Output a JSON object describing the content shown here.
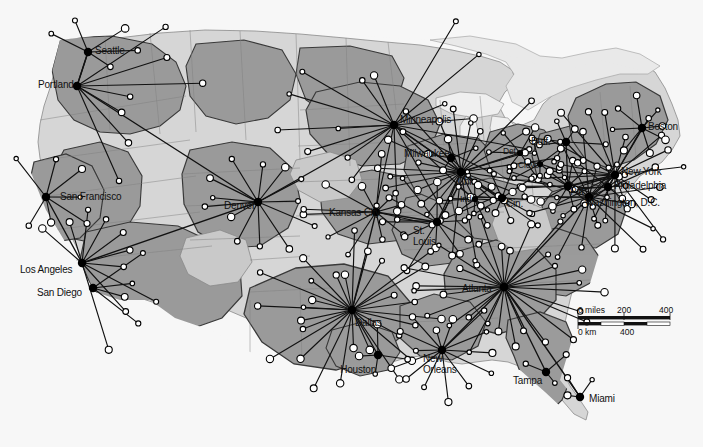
{
  "map": {
    "title": "United States Airline Hub-and-Spoke Network",
    "projection_note": "",
    "colors": {
      "background": "#f7f7f7",
      "territory_fill": "#9b9b9b",
      "territory_fill_light": "#c9c9c9",
      "land_neutral": "#d6d6d6",
      "water": "#efefef",
      "state_border": "#8a8a8a",
      "territory_border": "#3a3a3a",
      "route_line": "#111111",
      "hub_dot": "#000000",
      "spoke_dot_fill": "#ffffff",
      "spoke_dot_stroke": "#000000",
      "label_text": "#111111"
    }
  },
  "scale_bar": {
    "miles_label": "0 miles",
    "miles_mid": "200",
    "miles_end": "400",
    "km_label": "0 km",
    "km_mid": "400"
  },
  "hubs": [
    {
      "name": "Seattle",
      "label": "Seattle",
      "x": 88,
      "y": 52,
      "lx": 95,
      "ly": 45,
      "size": "major",
      "anchor": "left"
    },
    {
      "name": "Portland",
      "label": "Portland",
      "x": 77,
      "y": 86,
      "lx": 38,
      "ly": 79,
      "size": "major",
      "anchor": "left"
    },
    {
      "name": "San Francisco",
      "label": "San Francisco",
      "x": 46,
      "y": 197,
      "lx": 60,
      "ly": 191,
      "size": "major",
      "anchor": "left"
    },
    {
      "name": "Los Angeles",
      "label": "Los Angeles",
      "x": 82,
      "y": 263,
      "lx": 20,
      "ly": 264,
      "size": "major",
      "anchor": "left"
    },
    {
      "name": "San Diego",
      "label": "San Diego",
      "x": 93,
      "y": 288,
      "lx": 37,
      "ly": 287,
      "size": "major",
      "anchor": "left"
    },
    {
      "name": "Denver",
      "label": "Denver",
      "x": 258,
      "y": 202,
      "lx": 224,
      "ly": 200,
      "size": "major",
      "anchor": "left"
    },
    {
      "name": "Minneapolis",
      "label": "Minneapolis",
      "x": 394,
      "y": 125,
      "lx": 400,
      "ly": 114,
      "size": "major",
      "anchor": "left"
    },
    {
      "name": "Milwaukee",
      "label": "Milwaukee",
      "x": 451,
      "y": 158,
      "lx": 404,
      "ly": 148,
      "size": "major",
      "anchor": "left"
    },
    {
      "name": "Kansas City",
      "label": "Kansas City",
      "x": 376,
      "y": 212,
      "lx": 329,
      "ly": 207,
      "size": "major",
      "anchor": "left"
    },
    {
      "name": "St. Louis",
      "label": "St.",
      "label2": "Louis",
      "x": 437,
      "y": 222,
      "lx": 413,
      "ly": 225,
      "size": "major",
      "anchor": "left"
    },
    {
      "name": "Chicago",
      "label": "Chi.",
      "x": 461,
      "y": 172,
      "lx": 457,
      "ly": 176,
      "size": "major",
      "anchor": "left"
    },
    {
      "name": "Detroit",
      "label": "Det.",
      "x": 520,
      "y": 153,
      "lx": 503,
      "ly": 146,
      "size": "minor",
      "anchor": "left"
    },
    {
      "name": "Cleveland",
      "label": "Cleve.",
      "x": 540,
      "y": 164,
      "lx": 518,
      "ly": 160,
      "size": "minor",
      "anchor": "left"
    },
    {
      "name": "Buffalo",
      "label": "Buff.",
      "x": 566,
      "y": 142,
      "lx": 531,
      "ly": 136,
      "size": "major",
      "anchor": "left"
    },
    {
      "name": "Indianapolis",
      "label": "Ind.",
      "x": 475,
      "y": 199,
      "lx": 460,
      "ly": 194,
      "size": "minor",
      "anchor": "left"
    },
    {
      "name": "Cincinnati",
      "label": "Cin.",
      "x": 502,
      "y": 198,
      "lx": 506,
      "ly": 198,
      "size": "major",
      "anchor": "left"
    },
    {
      "name": "Pittsburgh",
      "label": "Pitt.",
      "x": 568,
      "y": 186,
      "lx": 570,
      "ly": 186,
      "size": "major",
      "anchor": "left"
    },
    {
      "name": "New York",
      "label": "New York",
      "x": 615,
      "y": 175,
      "lx": 621,
      "ly": 166,
      "size": "major",
      "anchor": "left"
    },
    {
      "name": "Boston",
      "label": "Boston",
      "x": 642,
      "y": 128,
      "lx": 648,
      "ly": 121,
      "size": "major",
      "anchor": "left"
    },
    {
      "name": "Philadelphia",
      "label": "Philadelphia",
      "x": 608,
      "y": 187,
      "lx": 614,
      "ly": 180,
      "size": "major",
      "anchor": "left"
    },
    {
      "name": "Washington, D.C.",
      "label": "Washington, D.C.",
      "x": 589,
      "y": 197,
      "lx": 585,
      "ly": 197,
      "size": "major",
      "anchor": "left"
    },
    {
      "name": "Atlanta",
      "label": "Atlanta",
      "x": 504,
      "y": 287,
      "lx": 462,
      "ly": 283,
      "size": "major",
      "anchor": "left"
    },
    {
      "name": "Dallas",
      "label": "Dallas",
      "x": 352,
      "y": 310,
      "lx": 355,
      "ly": 317,
      "size": "major",
      "anchor": "left"
    },
    {
      "name": "Houston",
      "label": "Houston",
      "x": 378,
      "y": 355,
      "lx": 376,
      "ly": 364,
      "size": "major",
      "anchor": "right"
    },
    {
      "name": "New Orleans",
      "label": "New",
      "label2": "Orleans",
      "x": 442,
      "y": 350,
      "lx": 423,
      "ly": 353,
      "size": "major",
      "anchor": "left"
    },
    {
      "name": "Tampa",
      "label": "Tampa",
      "x": 546,
      "y": 372,
      "lx": 513,
      "ly": 375,
      "size": "major",
      "anchor": "left"
    },
    {
      "name": "Miami",
      "label": "Miami",
      "x": 580,
      "y": 397,
      "lx": 589,
      "ly": 393,
      "size": "major",
      "anchor": "left"
    }
  ],
  "legend": {
    "hub_marker_label": "hub city",
    "spoke_marker_label": "spoke destination"
  },
  "counts": {
    "hub_count": 27
  }
}
